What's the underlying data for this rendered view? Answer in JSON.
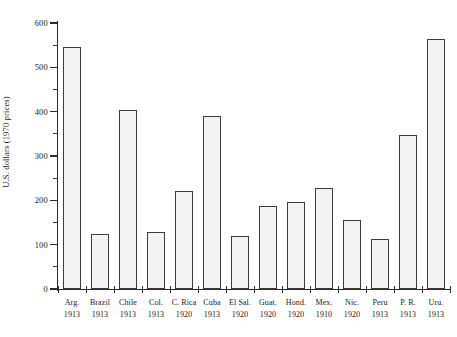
{
  "chart_data": {
    "type": "bar",
    "title": "",
    "subtitle": "",
    "xlabel": "",
    "ylabel": "U.S. dollars (1970 prices)",
    "ylim": [
      0,
      600
    ],
    "ytick_values": [
      0,
      100,
      200,
      300,
      400,
      500,
      600
    ],
    "ytick_labels": [
      "0",
      "100",
      "200",
      "300",
      "400",
      "500",
      "600"
    ],
    "yminor_values": [
      50,
      150,
      250,
      350,
      450,
      550
    ],
    "grid": false,
    "legend": null,
    "categories": [
      "Arg.",
      "Brazil",
      "Chile",
      "Col.",
      "C. Rica",
      "Cuba",
      "El Sal.",
      "Guat.",
      "Hond.",
      "Mex.",
      "Nic.",
      "Peru",
      "P. R.",
      "Uru."
    ],
    "category_years": [
      "1913",
      "1913",
      "1913",
      "1913",
      "1920",
      "1913",
      "1920",
      "1920",
      "1920",
      "1910",
      "1920",
      "1913",
      "1913",
      "1913"
    ],
    "values": [
      545,
      123,
      403,
      128,
      222,
      390,
      120,
      188,
      197,
      228,
      155,
      112,
      348,
      565
    ],
    "bar_fill": "#f2f2f2",
    "bar_edge": "#3c3c3c",
    "bar_pattern": "stipple-dots"
  },
  "axis": {
    "y_title": "U.S. dollars (1970 prices)"
  }
}
